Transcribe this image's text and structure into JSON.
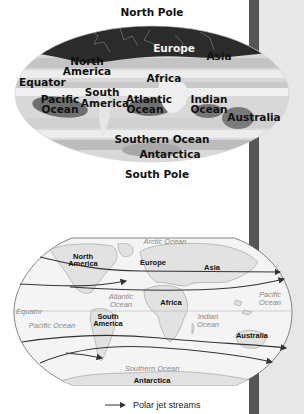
{
  "top_map": {
    "north_pole": "North Pole",
    "south_pole": "South Pole",
    "labels": {
      "europe": "Europe",
      "asia": "Asia",
      "north_america_1": "North",
      "north_america_2": "America",
      "equator": "Equator",
      "africa": "Africa",
      "south_america_1": "South",
      "south_america_2": "America",
      "pacific_1": "Pacific",
      "pacific_2": "Ocean",
      "atlantic_1": "Atlantic",
      "atlantic_2": "Ocean",
      "indian_1": "Indian",
      "indian_2": "Ocean",
      "australia": "Australia",
      "southern_ocean": "Southern Ocean",
      "antarctica": "Antarctica"
    }
  },
  "bottom_map": {
    "labels": {
      "arctic_ocean": "Arctic Ocean",
      "north_america_1": "North",
      "north_america_2": "America",
      "europe": "Europe",
      "asia": "Asia",
      "atlantic_1": "Atlantic",
      "atlantic_2": "Ocean",
      "africa": "Africa",
      "pacific_east_1": "Pacific",
      "pacific_east_2": "Ocean",
      "equator": "Equator",
      "pacific_west": "Pacific Ocean",
      "south_america_1": "South",
      "south_america_2": "America",
      "indian_1": "Indian",
      "indian_2": "Ocean",
      "australia": "Australia",
      "southern_ocean": "Southern Ocean",
      "antarctica": "Antarctica"
    }
  },
  "legend": {
    "label": "Polar jet streams",
    "icon": "arrow-right-icon"
  },
  "colors": {
    "side_bar": "#565656",
    "side_panel": "#e7e7e7",
    "top_map_dark_cap": "#2b2b2b",
    "ocean_dark": "#6e6e6e",
    "map_light": "#e9e9e9",
    "jet_stream": "#333333"
  }
}
